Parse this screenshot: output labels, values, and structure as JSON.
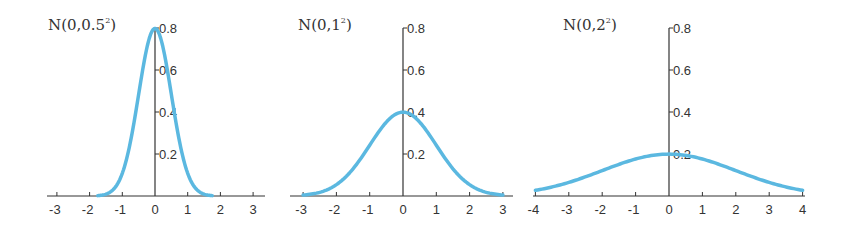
{
  "colors": {
    "curve": "#5bb8e0",
    "axis": "#333333"
  },
  "chart_data": [
    {
      "type": "line",
      "title": "N(0,0.5²)",
      "title_base": "N(0,0.5",
      "title_sup": "2",
      "title_close": ")",
      "mu": 0,
      "sigma": 0.5,
      "x_range": [
        -1.75,
        1.75
      ],
      "xticks": [
        -3,
        -2,
        -1,
        0,
        1,
        2,
        3
      ],
      "yticks": [
        0.2,
        0.4,
        0.6,
        0.8
      ],
      "ylim": [
        0,
        0.8
      ],
      "peak": 0.798,
      "geom": {
        "x0": 155,
        "ux": 32.7,
        "y0": 196,
        "uy": 210,
        "axis_left": 47,
        "axis_right": 265,
        "title_x": 48,
        "title_y": 30
      }
    },
    {
      "type": "line",
      "title": "N(0,1²)",
      "title_base": "N(0,1",
      "title_sup": "2",
      "title_close": ")",
      "mu": 0,
      "sigma": 1,
      "x_range": [
        -3,
        3
      ],
      "xticks": [
        -3,
        -2,
        -1,
        0,
        1,
        2,
        3
      ],
      "yticks": [
        0.2,
        0.4,
        0.6,
        0.8
      ],
      "ylim": [
        0,
        0.8
      ],
      "peak": 0.399,
      "geom": {
        "x0": 403,
        "ux": 33.3,
        "y0": 196,
        "uy": 210,
        "axis_left": 290,
        "axis_right": 513,
        "title_x": 298,
        "title_y": 30
      }
    },
    {
      "type": "line",
      "title": "N(0,2²)",
      "title_base": "N(0,2",
      "title_sup": "2",
      "title_close": ")",
      "mu": 0,
      "sigma": 2,
      "x_range": [
        -4,
        4
      ],
      "xticks": [
        -4,
        -3,
        -2,
        -1,
        0,
        1,
        2,
        3,
        4
      ],
      "yticks": [
        0.2,
        0.4,
        0.6,
        0.8
      ],
      "ylim": [
        0,
        0.8
      ],
      "peak": 0.199,
      "geom": {
        "x0": 669,
        "ux": 33.4,
        "y0": 196,
        "uy": 210,
        "axis_left": 533,
        "axis_right": 805,
        "title_x": 563,
        "title_y": 30
      }
    }
  ]
}
